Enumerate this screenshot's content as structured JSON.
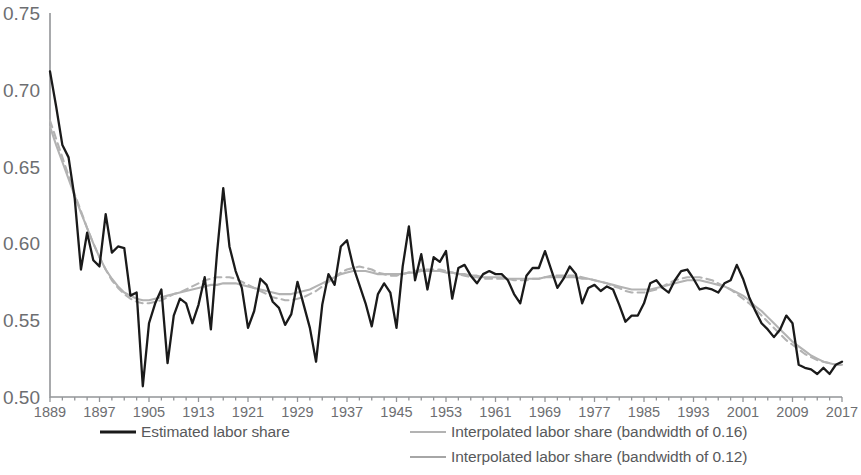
{
  "chart_data": {
    "type": "line",
    "title": "",
    "xlabel": "",
    "ylabel": "",
    "xlim": [
      1889,
      2017
    ],
    "ylim": [
      0.5,
      0.75
    ],
    "grid": false,
    "legend_position": "bottom",
    "x_tick_labels": [
      "1889",
      "1897",
      "1905",
      "1913",
      "1921",
      "1929",
      "1937",
      "1945",
      "1953",
      "1961",
      "1969",
      "1977",
      "1985",
      "1993",
      "2001",
      "2009",
      "2017"
    ],
    "x_tick_values": [
      1889,
      1897,
      1905,
      1913,
      1921,
      1929,
      1937,
      1945,
      1953,
      1961,
      1969,
      1977,
      1985,
      1993,
      2001,
      2009,
      2017
    ],
    "y_tick_labels": [
      "0.75",
      "0.70",
      "0.65",
      "0.60",
      "0.55",
      "0.50"
    ],
    "y_tick_values": [
      0.75,
      0.7,
      0.65,
      0.6,
      0.55,
      0.5
    ],
    "x": [
      1889,
      1890,
      1891,
      1892,
      1893,
      1894,
      1895,
      1896,
      1897,
      1898,
      1899,
      1900,
      1901,
      1902,
      1903,
      1904,
      1905,
      1906,
      1907,
      1908,
      1909,
      1910,
      1911,
      1912,
      1913,
      1914,
      1915,
      1916,
      1917,
      1918,
      1919,
      1920,
      1921,
      1922,
      1923,
      1924,
      1925,
      1926,
      1927,
      1928,
      1929,
      1930,
      1931,
      1932,
      1933,
      1934,
      1935,
      1936,
      1937,
      1938,
      1939,
      1940,
      1941,
      1942,
      1943,
      1944,
      1945,
      1946,
      1947,
      1948,
      1949,
      1950,
      1951,
      1952,
      1953,
      1954,
      1955,
      1956,
      1957,
      1958,
      1959,
      1960,
      1961,
      1962,
      1963,
      1964,
      1965,
      1966,
      1967,
      1968,
      1969,
      1970,
      1971,
      1972,
      1973,
      1974,
      1975,
      1976,
      1977,
      1978,
      1979,
      1980,
      1981,
      1982,
      1983,
      1984,
      1985,
      1986,
      1987,
      1988,
      1989,
      1990,
      1991,
      1992,
      1993,
      1994,
      1995,
      1996,
      1997,
      1998,
      1999,
      2000,
      2001,
      2002,
      2003,
      2004,
      2005,
      2006,
      2007,
      2008,
      2009,
      2010,
      2011,
      2012,
      2013,
      2014,
      2015,
      2016,
      2017
    ],
    "series": [
      {
        "name": "Estimated labor share",
        "style": "solid",
        "color": "#1a1a1a",
        "values": [
          0.712,
          0.689,
          0.664,
          0.656,
          0.629,
          0.583,
          0.607,
          0.589,
          0.585,
          0.619,
          0.594,
          0.598,
          0.597,
          0.566,
          0.568,
          0.507,
          0.548,
          0.561,
          0.57,
          0.522,
          0.553,
          0.564,
          0.561,
          0.548,
          0.56,
          0.578,
          0.544,
          0.594,
          0.636,
          0.598,
          0.582,
          0.571,
          0.545,
          0.556,
          0.577,
          0.573,
          0.562,
          0.558,
          0.547,
          0.554,
          0.575,
          0.56,
          0.545,
          0.523,
          0.56,
          0.58,
          0.573,
          0.598,
          0.602,
          0.585,
          0.573,
          0.561,
          0.546,
          0.567,
          0.574,
          0.568,
          0.545,
          0.585,
          0.611,
          0.576,
          0.593,
          0.57,
          0.591,
          0.588,
          0.595,
          0.564,
          0.584,
          0.586,
          0.579,
          0.574,
          0.58,
          0.582,
          0.58,
          0.58,
          0.576,
          0.567,
          0.561,
          0.579,
          0.584,
          0.584,
          0.595,
          0.583,
          0.571,
          0.577,
          0.585,
          0.58,
          0.561,
          0.571,
          0.573,
          0.569,
          0.572,
          0.57,
          0.56,
          0.549,
          0.553,
          0.553,
          0.561,
          0.574,
          0.576,
          0.571,
          0.568,
          0.576,
          0.582,
          0.583,
          0.577,
          0.57,
          0.571,
          0.57,
          0.568,
          0.574,
          0.576,
          0.586,
          0.577,
          0.565,
          0.556,
          0.548,
          0.544,
          0.539,
          0.544,
          0.553,
          0.548,
          0.521,
          0.519,
          0.518,
          0.515,
          0.519,
          0.515,
          0.521,
          0.523
        ]
      },
      {
        "name": "Interpolated labor share (bandwidth of 0.16)",
        "style": "solid",
        "color": "#b3b3b3",
        "values": [
          0.676,
          0.664,
          0.653,
          0.642,
          0.631,
          0.62,
          0.61,
          0.6,
          0.591,
          0.583,
          0.577,
          0.572,
          0.568,
          0.566,
          0.564,
          0.563,
          0.563,
          0.564,
          0.565,
          0.566,
          0.567,
          0.568,
          0.569,
          0.57,
          0.571,
          0.572,
          0.573,
          0.573,
          0.574,
          0.574,
          0.574,
          0.573,
          0.572,
          0.571,
          0.57,
          0.569,
          0.568,
          0.567,
          0.567,
          0.567,
          0.568,
          0.569,
          0.57,
          0.572,
          0.574,
          0.576,
          0.578,
          0.58,
          0.581,
          0.582,
          0.582,
          0.582,
          0.581,
          0.58,
          0.58,
          0.58,
          0.58,
          0.58,
          0.581,
          0.581,
          0.582,
          0.582,
          0.582,
          0.582,
          0.581,
          0.581,
          0.58,
          0.58,
          0.579,
          0.579,
          0.578,
          0.578,
          0.578,
          0.578,
          0.577,
          0.577,
          0.577,
          0.577,
          0.577,
          0.577,
          0.578,
          0.578,
          0.578,
          0.578,
          0.578,
          0.578,
          0.577,
          0.577,
          0.576,
          0.575,
          0.574,
          0.573,
          0.572,
          0.571,
          0.57,
          0.57,
          0.57,
          0.57,
          0.571,
          0.572,
          0.573,
          0.574,
          0.575,
          0.576,
          0.576,
          0.576,
          0.575,
          0.574,
          0.573,
          0.572,
          0.57,
          0.568,
          0.566,
          0.563,
          0.559,
          0.556,
          0.552,
          0.548,
          0.544,
          0.54,
          0.536,
          0.533,
          0.53,
          0.527,
          0.525,
          0.523,
          0.522,
          0.521,
          0.521
        ]
      },
      {
        "name": "Interpolated labor share (bandwidth of 0.12)",
        "style": "dashed",
        "color": "#a6a6a6",
        "values": [
          0.68,
          0.668,
          0.656,
          0.644,
          0.632,
          0.621,
          0.61,
          0.6,
          0.591,
          0.583,
          0.576,
          0.571,
          0.567,
          0.564,
          0.562,
          0.561,
          0.561,
          0.562,
          0.563,
          0.565,
          0.567,
          0.568,
          0.57,
          0.572,
          0.574,
          0.576,
          0.577,
          0.578,
          0.578,
          0.578,
          0.577,
          0.575,
          0.573,
          0.571,
          0.569,
          0.567,
          0.565,
          0.564,
          0.563,
          0.563,
          0.564,
          0.565,
          0.567,
          0.569,
          0.572,
          0.575,
          0.578,
          0.581,
          0.583,
          0.584,
          0.585,
          0.584,
          0.583,
          0.581,
          0.58,
          0.579,
          0.579,
          0.58,
          0.581,
          0.582,
          0.583,
          0.583,
          0.583,
          0.583,
          0.582,
          0.581,
          0.58,
          0.579,
          0.578,
          0.578,
          0.577,
          0.577,
          0.577,
          0.577,
          0.577,
          0.576,
          0.576,
          0.576,
          0.577,
          0.577,
          0.578,
          0.579,
          0.579,
          0.579,
          0.579,
          0.579,
          0.578,
          0.577,
          0.576,
          0.575,
          0.574,
          0.572,
          0.571,
          0.569,
          0.568,
          0.568,
          0.568,
          0.569,
          0.57,
          0.572,
          0.574,
          0.576,
          0.577,
          0.578,
          0.578,
          0.578,
          0.577,
          0.576,
          0.574,
          0.572,
          0.57,
          0.567,
          0.564,
          0.561,
          0.557,
          0.553,
          0.549,
          0.545,
          0.541,
          0.537,
          0.534,
          0.531,
          0.528,
          0.526,
          0.524,
          0.523,
          0.522,
          0.521,
          0.521
        ]
      }
    ]
  },
  "legend": {
    "entries": [
      {
        "label": "Estimated labor share",
        "swatch": "solid-dark"
      },
      {
        "label": "Interpolated labor share (bandwidth of 0.16)",
        "swatch": "solid-gray"
      },
      {
        "label": "Interpolated labor share (bandwidth of 0.12)",
        "swatch": "dashed-gray"
      }
    ]
  },
  "colors": {
    "estimated": "#1a1a1a",
    "smooth_16": "#b3b3b3",
    "smooth_12": "#a6a6a6",
    "axis": "#939598",
    "text": "#58595b",
    "background": "#ffffff"
  }
}
